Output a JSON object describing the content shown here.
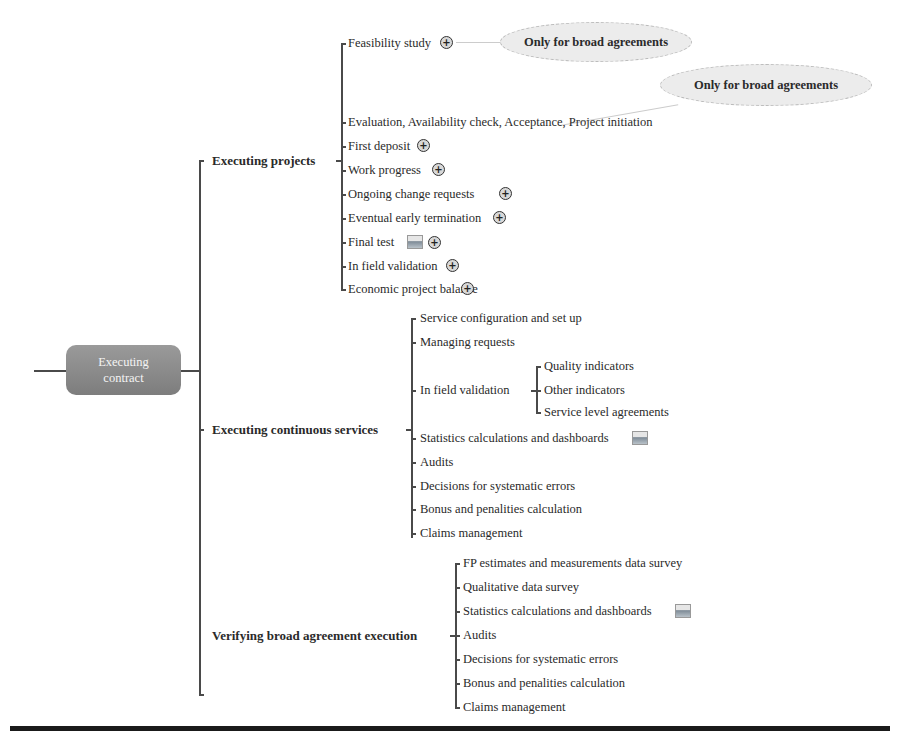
{
  "root": {
    "label_line1": "Executing",
    "label_line2": "contract"
  },
  "branches": [
    {
      "label": "Executing projects",
      "children": [
        {
          "label": "Feasibility study",
          "icons": [
            "expand-plus"
          ]
        },
        {
          "label": "Evaluation, Availability check, Acceptance, Project initiation",
          "icons": []
        },
        {
          "label": "First deposit",
          "icons": [
            "expand-plus"
          ]
        },
        {
          "label": "Work progress",
          "icons": [
            "expand-plus"
          ]
        },
        {
          "label": "Ongoing change requests",
          "icons": [
            "expand-plus"
          ]
        },
        {
          "label": "Eventual early termination",
          "icons": [
            "expand-plus"
          ]
        },
        {
          "label": "Final test",
          "icons": [
            "image",
            "expand-plus"
          ]
        },
        {
          "label": "In field validation",
          "icons": [
            "expand-plus"
          ]
        },
        {
          "label": "Economic project balance",
          "icons": [
            "expand-plus"
          ]
        }
      ]
    },
    {
      "label": "Executing continuous services",
      "children": [
        {
          "label": "Service configuration and set up"
        },
        {
          "label": "Managing requests"
        },
        {
          "label": "In field validation",
          "children": [
            {
              "label": "Quality indicators"
            },
            {
              "label": "Other indicators"
            },
            {
              "label": "Service level agreements"
            }
          ]
        },
        {
          "label": "Statistics calculations and dashboards",
          "icons": [
            "image"
          ]
        },
        {
          "label": "Audits"
        },
        {
          "label": "Decisions for systematic errors"
        },
        {
          "label": "Bonus and penalities calculation"
        },
        {
          "label": "Claims management"
        }
      ]
    },
    {
      "label": "Verifying broad agreement execution",
      "children": [
        {
          "label": "FP estimates and measurements data survey"
        },
        {
          "label": "Qualitative data survey"
        },
        {
          "label": "Statistics calculations and dashboards",
          "icons": [
            "image"
          ]
        },
        {
          "label": "Audits"
        },
        {
          "label": "Decisions for systematic errors"
        },
        {
          "label": "Bonus and penalities calculation"
        },
        {
          "label": "Claims management"
        }
      ]
    }
  ],
  "callouts": [
    {
      "label": "Only for broad agreements",
      "attached_to": "Feasibility study"
    },
    {
      "label": "Only for broad agreements",
      "attached_to": "Evaluation, Availability check, Acceptance, Project initiation"
    }
  ],
  "colors": {
    "root_fill": "#8a8a8a",
    "line": "#4a4a4a",
    "callout_fill": "#ececec",
    "rule": "#1a1a1a"
  }
}
